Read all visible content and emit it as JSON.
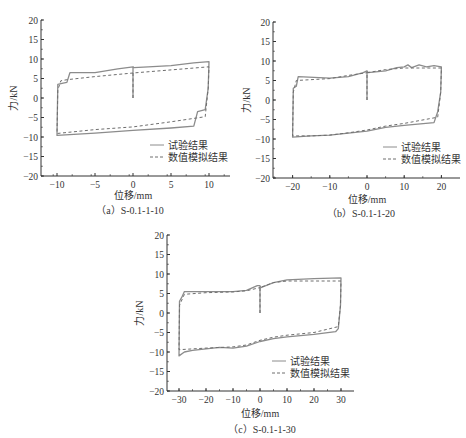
{
  "chart_data": [
    {
      "type": "line",
      "caption": "（a）S-0.1-1-10",
      "xlabel": "位移/mm",
      "ylabel": "力/kN",
      "xlim": [
        -13,
        13
      ],
      "ylim": [
        -20,
        20
      ],
      "xticks": [
        -10,
        -5,
        0,
        5,
        10
      ],
      "yticks": [
        -20,
        -15,
        -10,
        -5,
        0,
        5,
        10,
        15,
        20
      ],
      "legend": [
        "试验结果",
        "数值模拟结果"
      ],
      "series": [
        {
          "name": "试验结果",
          "style": "solid",
          "x": [
            0,
            0,
            0.1,
            2,
            5,
            8,
            10,
            10,
            9.9,
            9.5,
            8.5,
            8,
            5,
            0,
            -5,
            -10,
            -10,
            -9.9,
            -9.2,
            -8.7,
            -8.3,
            -5,
            -2,
            0,
            0.1
          ],
          "y": [
            0,
            8,
            7.8,
            8,
            8.3,
            9,
            9.3,
            9.3,
            2.5,
            -3,
            -3.5,
            -7.2,
            -7.7,
            -8.3,
            -9,
            -9.6,
            -9.5,
            3.5,
            3.8,
            4,
            6.5,
            6.5,
            7.5,
            8,
            8
          ]
        },
        {
          "name": "数值模拟结果",
          "style": "dashed",
          "x": [
            0,
            0,
            10,
            10,
            9.9,
            9.5,
            5,
            0,
            -5,
            -10,
            -10,
            -9.9,
            -9.5,
            -8.7,
            -5,
            0
          ],
          "y": [
            0,
            6.4,
            8,
            8,
            2.5,
            -4.8,
            -6.1,
            -7.4,
            -8.1,
            -9.1,
            -9.1,
            2,
            4.4,
            4.7,
            5.5,
            6.4
          ]
        }
      ]
    },
    {
      "type": "line",
      "caption": "（b）S-0.1-1-20",
      "xlabel": "位移/mm",
      "ylabel": "力/kN",
      "xlim": [
        -25,
        25
      ],
      "ylim": [
        -20,
        20
      ],
      "xticks": [
        -20,
        -10,
        0,
        10,
        20
      ],
      "yticks": [
        -20,
        -15,
        -10,
        -5,
        0,
        5,
        10,
        15,
        20
      ],
      "legend": [
        "试验结果",
        "数值模拟结果"
      ],
      "series": [
        {
          "name": "试验结果",
          "style": "solid",
          "x": [
            0,
            0,
            0.3,
            5,
            8,
            10,
            11,
            12,
            14,
            16,
            18,
            20,
            20,
            19.8,
            19,
            18,
            10,
            5,
            0,
            -5,
            -10,
            -15,
            -20,
            -20,
            -19.8,
            -19,
            -18.5,
            -10,
            -5,
            -1,
            0,
            0.1
          ],
          "y": [
            0,
            7.5,
            7,
            7.5,
            8.3,
            8.5,
            9,
            8.3,
            9,
            8.5,
            8.8,
            8.5,
            8.5,
            2,
            -3,
            -5.8,
            -6.5,
            -7,
            -8,
            -8.5,
            -9,
            -9.2,
            -9.5,
            -9.5,
            3,
            3.5,
            6,
            5.6,
            6,
            7,
            7.5,
            7.5
          ]
        },
        {
          "name": "数值模拟结果",
          "style": "dashed",
          "x": [
            0,
            0,
            5,
            10,
            20,
            20,
            19.8,
            19,
            10,
            5,
            0,
            -5,
            -10,
            -15,
            -20,
            -20,
            -19.8,
            -19,
            -10,
            -5,
            0
          ],
          "y": [
            0,
            7,
            7.8,
            8.2,
            8.2,
            8.2,
            2,
            -4.4,
            -6,
            -6.7,
            -7.7,
            -8.4,
            -9,
            -9.2,
            -9.2,
            -9.2,
            2,
            5,
            5.5,
            6.3,
            7
          ]
        }
      ]
    },
    {
      "type": "line",
      "caption": "（c）S-0.1-1-30",
      "xlabel": "位移/mm",
      "ylabel": "力/kN",
      "xlim": [
        -35,
        35
      ],
      "ylim": [
        -20,
        20
      ],
      "xticks": [
        -30,
        -20,
        -10,
        0,
        10,
        20,
        30
      ],
      "yticks": [
        -20,
        -15,
        -10,
        -5,
        0,
        5,
        10,
        15,
        20
      ],
      "legend": [
        "试验结果",
        "数值模拟结果"
      ],
      "series": [
        {
          "name": "试验结果",
          "style": "solid",
          "x": [
            0,
            0,
            0.3,
            5,
            10,
            20,
            30,
            30,
            29.8,
            29,
            28,
            20,
            10,
            5,
            0,
            -5,
            -10,
            -15,
            -20,
            -25,
            -28,
            -30,
            -30,
            -29.8,
            -29,
            -28,
            -20,
            -10,
            -5,
            -1,
            0
          ],
          "y": [
            0,
            7,
            6.5,
            7.8,
            8.5,
            8.8,
            9,
            9,
            2,
            -4,
            -4.8,
            -5.5,
            -6.1,
            -6.6,
            -7.3,
            -8.5,
            -9,
            -8.8,
            -9.2,
            -9.6,
            -10,
            -11,
            -11,
            3,
            4,
            5.5,
            5.5,
            5.5,
            5.8,
            7,
            7
          ]
        },
        {
          "name": "数值模拟结果",
          "style": "dashed",
          "x": [
            0,
            0,
            5,
            10,
            20,
            30,
            30,
            29.8,
            29,
            20,
            10,
            5,
            0,
            -5,
            -10,
            -20,
            -30,
            -30,
            -29.8,
            -28,
            -20,
            -10,
            -5,
            0
          ],
          "y": [
            0,
            6.5,
            7.8,
            8.2,
            8.2,
            8.2,
            8.2,
            2,
            -3.5,
            -5,
            -5.7,
            -6.2,
            -7,
            -8.2,
            -8.7,
            -9,
            -9.4,
            -9.4,
            2,
            4.8,
            5.2,
            5.4,
            5.7,
            6.5
          ]
        }
      ]
    }
  ],
  "panels": [
    {
      "caption": "（a）S-0.1-1-10",
      "xlabel": "位移/mm",
      "ylabel": "力/kN",
      "legend_solid": "试验结果",
      "legend_dashed": "数值模拟结果"
    },
    {
      "caption": "（b）S-0.1-1-20",
      "xlabel": "位移/mm",
      "ylabel": "力/kN",
      "legend_solid": "试验结果",
      "legend_dashed": "数值模拟结果"
    },
    {
      "caption": "（c）S-0.1-1-30",
      "xlabel": "位移/mm",
      "ylabel": "力/kN",
      "legend_solid": "试验结果",
      "legend_dashed": "数值模拟结果"
    }
  ],
  "colors": {
    "solid": "#8c8c8c",
    "dashed": "#6e6e6e",
    "axis": "#333333"
  }
}
